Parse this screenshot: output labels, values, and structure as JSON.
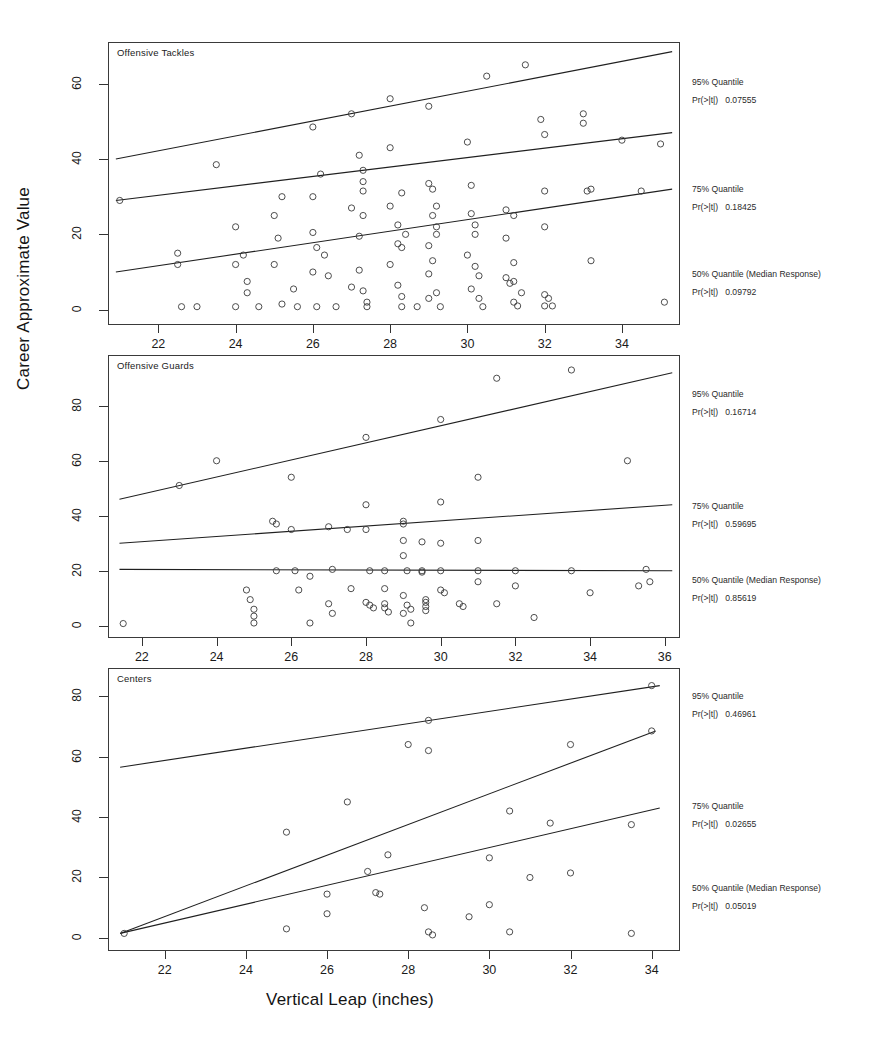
{
  "figure": {
    "xlabel": "Vertical Leap (inches)",
    "ylabel": "Career Approximate Value"
  },
  "chart_data": {
    "type": "scatter",
    "title": "",
    "xlabel": "Vertical Leap (inches)",
    "ylabel": "Career Approximate Value",
    "grid": false,
    "legend": "right-annotations",
    "panels": [
      {
        "name": "Offensive Tackles",
        "xlim": [
          20.8,
          35.4
        ],
        "ylim": [
          -3,
          70
        ],
        "xticks": [
          22,
          24,
          26,
          28,
          30,
          32,
          34
        ],
        "yticks": [
          0,
          20,
          40,
          60
        ],
        "annotations": [
          {
            "label": "95% Quantile",
            "stat": "Pr(>|t|)",
            "value": "0.07555"
          },
          {
            "label": "75% Quantile",
            "stat": "Pr(>|t|)",
            "value": "0.18425"
          },
          {
            "label": "50% Quantile (Median Response)",
            "stat": "Pr(>|t|)",
            "value": "0.09792"
          }
        ],
        "fits": [
          {
            "quantile": 95,
            "x0": 20.9,
            "y0": 40.0,
            "x1": 35.3,
            "y1": 68.5
          },
          {
            "quantile": 75,
            "x0": 20.9,
            "y0": 29.0,
            "x1": 35.3,
            "y1": 47.0
          },
          {
            "quantile": 50,
            "x0": 20.9,
            "y0": 10.0,
            "x1": 35.3,
            "y1": 32.0
          }
        ],
        "points": [
          [
            21.0,
            29.0
          ],
          [
            22.5,
            15.0
          ],
          [
            22.5,
            12.0
          ],
          [
            22.6,
            0.8
          ],
          [
            23.0,
            0.8
          ],
          [
            23.5,
            38.5
          ],
          [
            24.0,
            22.0
          ],
          [
            24.2,
            14.5
          ],
          [
            24.0,
            12.0
          ],
          [
            24.3,
            7.5
          ],
          [
            24.3,
            4.5
          ],
          [
            24.0,
            0.8
          ],
          [
            24.6,
            0.8
          ],
          [
            25.2,
            30.0
          ],
          [
            25.0,
            25.0
          ],
          [
            25.1,
            19.0
          ],
          [
            25.0,
            12.0
          ],
          [
            25.2,
            1.5
          ],
          [
            25.5,
            5.5
          ],
          [
            25.6,
            0.8
          ],
          [
            26.0,
            48.5
          ],
          [
            26.0,
            30.0
          ],
          [
            26.2,
            36.0
          ],
          [
            26.0,
            20.5
          ],
          [
            26.1,
            16.5
          ],
          [
            26.3,
            14.5
          ],
          [
            26.0,
            10.0
          ],
          [
            26.4,
            9.0
          ],
          [
            26.1,
            0.8
          ],
          [
            26.6,
            0.8
          ],
          [
            27.0,
            52.0
          ],
          [
            27.2,
            41.0
          ],
          [
            27.3,
            37.0
          ],
          [
            27.3,
            34.0
          ],
          [
            27.3,
            31.5
          ],
          [
            27.0,
            27.0
          ],
          [
            27.3,
            25.0
          ],
          [
            27.2,
            19.5
          ],
          [
            27.2,
            10.5
          ],
          [
            27.0,
            6.0
          ],
          [
            27.3,
            5.0
          ],
          [
            27.4,
            2.0
          ],
          [
            27.4,
            0.8
          ],
          [
            28.0,
            56.0
          ],
          [
            28.0,
            43.0
          ],
          [
            28.3,
            31.0
          ],
          [
            28.0,
            27.5
          ],
          [
            28.2,
            22.5
          ],
          [
            28.4,
            20.0
          ],
          [
            28.2,
            17.5
          ],
          [
            28.3,
            16.5
          ],
          [
            28.0,
            12.0
          ],
          [
            28.2,
            6.5
          ],
          [
            28.3,
            3.5
          ],
          [
            28.3,
            0.8
          ],
          [
            28.7,
            0.8
          ],
          [
            29.0,
            54.0
          ],
          [
            29.0,
            33.5
          ],
          [
            29.1,
            32.0
          ],
          [
            29.2,
            27.5
          ],
          [
            29.1,
            25.0
          ],
          [
            29.2,
            22.0
          ],
          [
            29.2,
            20.0
          ],
          [
            29.0,
            17.0
          ],
          [
            29.1,
            13.0
          ],
          [
            29.0,
            9.5
          ],
          [
            29.2,
            4.5
          ],
          [
            29.0,
            3.0
          ],
          [
            29.3,
            0.8
          ],
          [
            30.0,
            44.5
          ],
          [
            30.1,
            33.0
          ],
          [
            30.1,
            25.5
          ],
          [
            30.2,
            22.5
          ],
          [
            30.2,
            20.0
          ],
          [
            30.0,
            14.5
          ],
          [
            30.2,
            11.5
          ],
          [
            30.3,
            9.0
          ],
          [
            30.1,
            5.5
          ],
          [
            30.3,
            3.0
          ],
          [
            30.5,
            62.0
          ],
          [
            30.4,
            0.8
          ],
          [
            31.0,
            26.5
          ],
          [
            31.2,
            25.0
          ],
          [
            31.0,
            19.0
          ],
          [
            31.2,
            12.5
          ],
          [
            31.0,
            8.5
          ],
          [
            31.2,
            7.5
          ],
          [
            31.1,
            7.0
          ],
          [
            31.4,
            4.5
          ],
          [
            31.2,
            2.0
          ],
          [
            31.3,
            1.0
          ],
          [
            31.5,
            65.0
          ],
          [
            31.9,
            50.5
          ],
          [
            32.0,
            46.5
          ],
          [
            32.0,
            31.5
          ],
          [
            32.0,
            22.0
          ],
          [
            32.0,
            4.0
          ],
          [
            32.1,
            3.0
          ],
          [
            32.0,
            1.0
          ],
          [
            32.2,
            1.0
          ],
          [
            33.0,
            52.0
          ],
          [
            33.0,
            49.5
          ],
          [
            33.2,
            32.0
          ],
          [
            33.1,
            31.5
          ],
          [
            33.2,
            13.0
          ],
          [
            34.0,
            45.0
          ],
          [
            34.5,
            31.5
          ],
          [
            35.0,
            44.0
          ],
          [
            35.1,
            2.0
          ]
        ]
      },
      {
        "name": "Offensive Guards",
        "xlim": [
          21.2,
          36.3
        ],
        "ylim": [
          -3,
          97
        ],
        "xticks": [
          22,
          24,
          26,
          28,
          30,
          32,
          34,
          36
        ],
        "yticks": [
          0,
          20,
          40,
          60,
          80
        ],
        "annotations": [
          {
            "label": "95% Quantile",
            "stat": "Pr(>|t|)",
            "value": "0.16714"
          },
          {
            "label": "75% Quantile",
            "stat": "Pr(>|t|)",
            "value": "0.59695"
          },
          {
            "label": "50% Quantile (Median Response)",
            "stat": "Pr(>|t|)",
            "value": "0.85619"
          }
        ],
        "fits": [
          {
            "quantile": 95,
            "x0": 21.4,
            "y0": 46.0,
            "x1": 36.2,
            "y1": 92.0
          },
          {
            "quantile": 75,
            "x0": 21.4,
            "y0": 30.0,
            "x1": 36.2,
            "y1": 44.0
          },
          {
            "quantile": 50,
            "x0": 21.4,
            "y0": 20.5,
            "x1": 36.2,
            "y1": 20.0
          }
        ],
        "points": [
          [
            21.5,
            0.8
          ],
          [
            23.0,
            51.0
          ],
          [
            24.0,
            60.0
          ],
          [
            24.8,
            13.0
          ],
          [
            24.9,
            9.5
          ],
          [
            25.0,
            6.0
          ],
          [
            25.0,
            3.5
          ],
          [
            25.0,
            1.0
          ],
          [
            25.5,
            38.0
          ],
          [
            25.6,
            37.0
          ],
          [
            25.6,
            20.0
          ],
          [
            26.0,
            54.0
          ],
          [
            26.0,
            35.0
          ],
          [
            26.1,
            20.0
          ],
          [
            26.2,
            13.0
          ],
          [
            26.5,
            18.0
          ],
          [
            26.5,
            1.0
          ],
          [
            27.0,
            36.0
          ],
          [
            27.1,
            20.5
          ],
          [
            27.0,
            8.0
          ],
          [
            27.1,
            4.5
          ],
          [
            27.5,
            35.0
          ],
          [
            27.6,
            13.5
          ],
          [
            28.0,
            68.5
          ],
          [
            28.0,
            44.0
          ],
          [
            28.0,
            35.0
          ],
          [
            28.1,
            20.0
          ],
          [
            28.0,
            8.5
          ],
          [
            28.1,
            7.5
          ],
          [
            28.2,
            6.5
          ],
          [
            28.5,
            20.0
          ],
          [
            28.5,
            13.5
          ],
          [
            28.5,
            8.0
          ],
          [
            28.5,
            6.5
          ],
          [
            28.6,
            5.0
          ],
          [
            29.0,
            38.0
          ],
          [
            29.0,
            37.0
          ],
          [
            29.0,
            31.0
          ],
          [
            29.0,
            25.5
          ],
          [
            29.1,
            20.0
          ],
          [
            29.0,
            11.0
          ],
          [
            29.1,
            7.5
          ],
          [
            29.2,
            6.0
          ],
          [
            29.0,
            4.5
          ],
          [
            29.2,
            1.0
          ],
          [
            29.5,
            30.5
          ],
          [
            29.5,
            20.0
          ],
          [
            29.5,
            19.5
          ],
          [
            29.6,
            9.5
          ],
          [
            29.6,
            8.5
          ],
          [
            29.6,
            7.0
          ],
          [
            29.6,
            5.5
          ],
          [
            30.0,
            75.0
          ],
          [
            30.0,
            45.0
          ],
          [
            30.0,
            30.0
          ],
          [
            30.0,
            20.0
          ],
          [
            30.0,
            13.0
          ],
          [
            30.1,
            12.0
          ],
          [
            30.5,
            8.0
          ],
          [
            30.6,
            7.0
          ],
          [
            31.0,
            54.0
          ],
          [
            31.0,
            31.0
          ],
          [
            31.0,
            20.0
          ],
          [
            31.0,
            16.0
          ],
          [
            31.5,
            90.0
          ],
          [
            31.5,
            8.0
          ],
          [
            32.0,
            20.0
          ],
          [
            32.0,
            14.5
          ],
          [
            32.5,
            3.0
          ],
          [
            33.5,
            93.0
          ],
          [
            33.5,
            20.0
          ],
          [
            34.0,
            12.0
          ],
          [
            35.0,
            60.0
          ],
          [
            35.3,
            14.5
          ],
          [
            35.5,
            20.5
          ],
          [
            35.6,
            16.0
          ]
        ]
      },
      {
        "name": "Centers",
        "xlim": [
          20.7,
          34.6
        ],
        "ylim": [
          -3,
          88
        ],
        "xticks": [
          22,
          24,
          26,
          28,
          30,
          32,
          34
        ],
        "yticks": [
          0,
          20,
          40,
          60,
          80
        ],
        "annotations": [
          {
            "label": "95% Quantile",
            "stat": "Pr(>|t|)",
            "value": "0.46961"
          },
          {
            "label": "75% Quantile",
            "stat": "Pr(>|t|)",
            "value": "0.02655"
          },
          {
            "label": "50% Quantile (Median Response)",
            "stat": "Pr(>|t|)",
            "value": "0.05019"
          }
        ],
        "fits": [
          {
            "quantile": 95,
            "x0": 20.9,
            "y0": 56.5,
            "x1": 34.2,
            "y1": 83.5
          },
          {
            "quantile": 75,
            "x0": 20.9,
            "y0": 1.5,
            "x1": 34.1,
            "y1": 68.5
          },
          {
            "quantile": 50,
            "x0": 20.9,
            "y0": 1.5,
            "x1": 34.2,
            "y1": 43.0
          }
        ],
        "points": [
          [
            21.0,
            1.5
          ],
          [
            25.0,
            35.0
          ],
          [
            25.0,
            3.0
          ],
          [
            26.0,
            14.5
          ],
          [
            26.0,
            8.0
          ],
          [
            26.5,
            45.0
          ],
          [
            27.0,
            22.0
          ],
          [
            27.2,
            15.0
          ],
          [
            27.3,
            14.5
          ],
          [
            27.5,
            27.5
          ],
          [
            28.0,
            64.0
          ],
          [
            28.5,
            72.0
          ],
          [
            28.5,
            62.0
          ],
          [
            28.4,
            10.0
          ],
          [
            28.5,
            2.0
          ],
          [
            28.6,
            1.0
          ],
          [
            29.5,
            7.0
          ],
          [
            30.0,
            26.5
          ],
          [
            30.0,
            11.0
          ],
          [
            30.5,
            42.0
          ],
          [
            30.5,
            2.0
          ],
          [
            31.0,
            20.0
          ],
          [
            31.5,
            38.0
          ],
          [
            32.0,
            21.5
          ],
          [
            32.0,
            64.0
          ],
          [
            33.5,
            37.5
          ],
          [
            33.5,
            1.5
          ],
          [
            34.0,
            68.5
          ],
          [
            34.0,
            83.5
          ]
        ]
      }
    ]
  }
}
